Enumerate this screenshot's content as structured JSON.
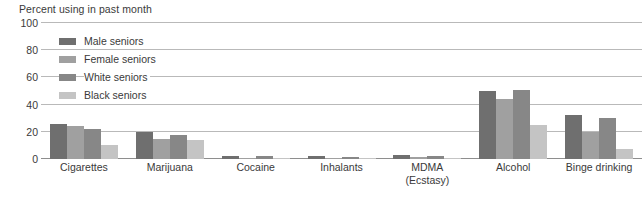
{
  "chart_data": {
    "type": "bar",
    "title": "Percent using in past month",
    "xlabel": "",
    "ylabel": "Percent using in past month",
    "ylim": [
      0,
      100
    ],
    "yticks": [
      0,
      20,
      40,
      60,
      80,
      100
    ],
    "ytick_labels": [
      "0",
      "20",
      "40",
      "60",
      "80",
      "100"
    ],
    "grid": true,
    "legend_position": "upper-left-inside",
    "categories": [
      "Cigarettes",
      "Marijuana",
      "Cocaine",
      "Inhalants",
      "MDMA (Ecstasy)",
      "Alcohol",
      "Binge drinking"
    ],
    "category_lines": [
      [
        "Cigarettes"
      ],
      [
        "Marijuana"
      ],
      [
        "Cocaine"
      ],
      [
        "Inhalants"
      ],
      [
        "MDMA",
        "(Ecstasy)"
      ],
      [
        "Alcohol"
      ],
      [
        "Binge drinking"
      ]
    ],
    "series": [
      {
        "name": "Male seniors",
        "color": "#6f6f6f",
        "values": [
          26,
          20,
          2,
          2,
          3,
          50,
          32
        ]
      },
      {
        "name": "Female seniors",
        "color": "#a0a0a0",
        "values": [
          24,
          15,
          1,
          1,
          1.5,
          44,
          20
        ]
      },
      {
        "name": "White seniors",
        "color": "#878787",
        "values": [
          22,
          18,
          2,
          1.5,
          2.5,
          51,
          30
        ]
      },
      {
        "name": "Black seniors",
        "color": "#c4c4c4",
        "values": [
          10,
          14,
          0.5,
          1,
          0.8,
          25,
          7
        ]
      }
    ]
  },
  "colors": {
    "gridline": "#b9b9b9",
    "axis": "#8e8e8e",
    "text": "#3a3a3a",
    "background": "#ffffff"
  }
}
